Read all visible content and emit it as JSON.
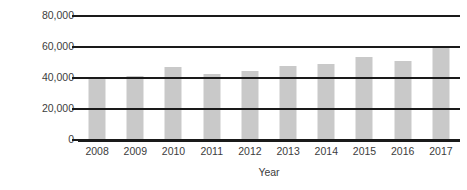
{
  "chart_data": {
    "type": "bar",
    "title": "",
    "xlabel": "Year",
    "ylabel": "Million PLN",
    "categories": [
      "2008",
      "2009",
      "2010",
      "2011",
      "2012",
      "2013",
      "2014",
      "2015",
      "2016",
      "2017"
    ],
    "values": [
      40000,
      41500,
      47000,
      42500,
      44500,
      48000,
      49000,
      53500,
      51000,
      60000
    ],
    "series": [
      {
        "name": "Million PLN",
        "values": [
          40000,
          41500,
          47000,
          42500,
          44500,
          48000,
          49000,
          53500,
          51000,
          60000
        ]
      }
    ],
    "ylim": [
      0,
      80000
    ],
    "yticks": [
      0,
      20000,
      40000,
      60000,
      80000
    ],
    "ytick_labels": [
      "0",
      "20,000",
      "40,000",
      "60,000",
      "80,000"
    ],
    "grid": true,
    "grid_axis": "y",
    "legend": false,
    "legend_position": "none",
    "bar_color": "#c9c9c9",
    "gridline_color": "#1a1a1a",
    "text_color": "#3c3c3c"
  }
}
